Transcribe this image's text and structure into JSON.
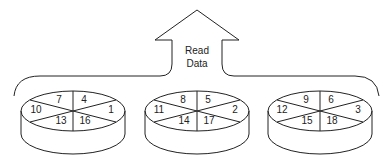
{
  "arrow": {
    "line1": "Read",
    "line2": "Data"
  },
  "disks": [
    {
      "segments": {
        "top_left": "7",
        "top_right": "4",
        "left": "10",
        "right": "1",
        "bottom_left": "13",
        "bottom_right": "16"
      }
    },
    {
      "segments": {
        "top_left": "8",
        "top_right": "5",
        "left": "11",
        "right": "2",
        "bottom_left": "14",
        "bottom_right": "17"
      }
    },
    {
      "segments": {
        "top_left": "9",
        "top_right": "6",
        "left": "12",
        "right": "3",
        "bottom_left": "15",
        "bottom_right": "18"
      }
    }
  ]
}
